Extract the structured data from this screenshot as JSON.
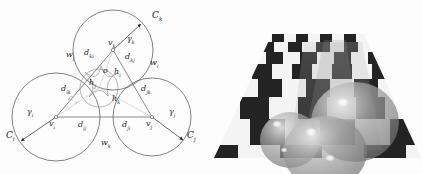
{
  "figure": {
    "panels": [
      "circle-tangency-diagram",
      "raytraced-spheres-on-checkerboard"
    ],
    "background_color": "#fdfdfd"
  },
  "diagram": {
    "stroke_color": "#3c3c3c",
    "faint_color": "#b4b4b4",
    "labels": {
      "circle_k": "C",
      "circle_k_sub": "k",
      "circle_i": "C",
      "circle_i_sub": "i",
      "circle_j": "C",
      "circle_j_sub": "j",
      "circle_o": "C",
      "circle_o_sub": "o",
      "vertex_k": "v",
      "vertex_k_sub": "k",
      "vertex_i": "v",
      "vertex_i_sub": "i",
      "vertex_j": "v",
      "vertex_j_sub": "j",
      "gamma_k": "γ",
      "gamma_k_sub": "k",
      "gamma_i": "γ",
      "gamma_i_sub": "i",
      "gamma_j": "γ",
      "gamma_j_sub": "j",
      "d_ki": "d",
      "d_ki_sub": "ki",
      "d_kj": "d",
      "d_kj_sub": "kj",
      "d_ik": "d",
      "d_ik_sub": "ik",
      "d_jk": "d",
      "d_jk_sub": "jk",
      "d_ij": "d",
      "d_ij_sub": "ij",
      "d_ji": "d",
      "d_ji_sub": "ji",
      "w_i": "w",
      "w_i_sub": "i",
      "w_j": "w",
      "w_j_sub": "j",
      "w_k": "w",
      "w_k_sub": "k",
      "h_i": "h",
      "h_i_sub": "i",
      "h_j": "h",
      "h_j_sub": "j",
      "h_k": "h",
      "h_k_sub": "k",
      "center_o": "o"
    }
  },
  "render": {
    "description": "perspective checkerboard floor with three translucent spheres",
    "checker_light": "#f2f2f2",
    "checker_dark": "#242424",
    "sphere_tint": "#9a9a9a",
    "highlight_color": "#ffffff",
    "sphere_count": 3
  }
}
